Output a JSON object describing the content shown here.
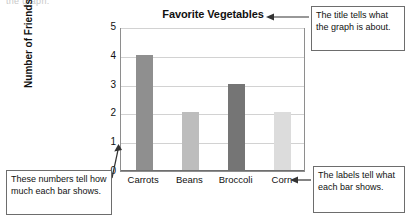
{
  "page_crumb": "the graph.",
  "chart_data": {
    "type": "bar",
    "title": "Favorite Vegetables",
    "xlabel": "",
    "ylabel": "Number of Friends",
    "categories": [
      "Carrots",
      "Beans",
      "Broccoli",
      "Corn"
    ],
    "values": [
      4,
      2,
      3,
      2
    ],
    "bar_colors": [
      "#8f8f8f",
      "#bdbdbd",
      "#757575",
      "#dcdcdc"
    ],
    "yticks": [
      0,
      1,
      2,
      3,
      4,
      5
    ],
    "ylim": [
      0,
      5
    ],
    "grid": true,
    "legend": "none"
  },
  "callouts": {
    "title_note": {
      "name": "title-callout",
      "text": "The title tells what the graph is about."
    },
    "numbers_note": {
      "name": "numbers-callout",
      "text": "These numbers tell how much each bar shows."
    },
    "labels_note": {
      "name": "labels-callout",
      "text": "The labels tell what each bar shows."
    }
  }
}
